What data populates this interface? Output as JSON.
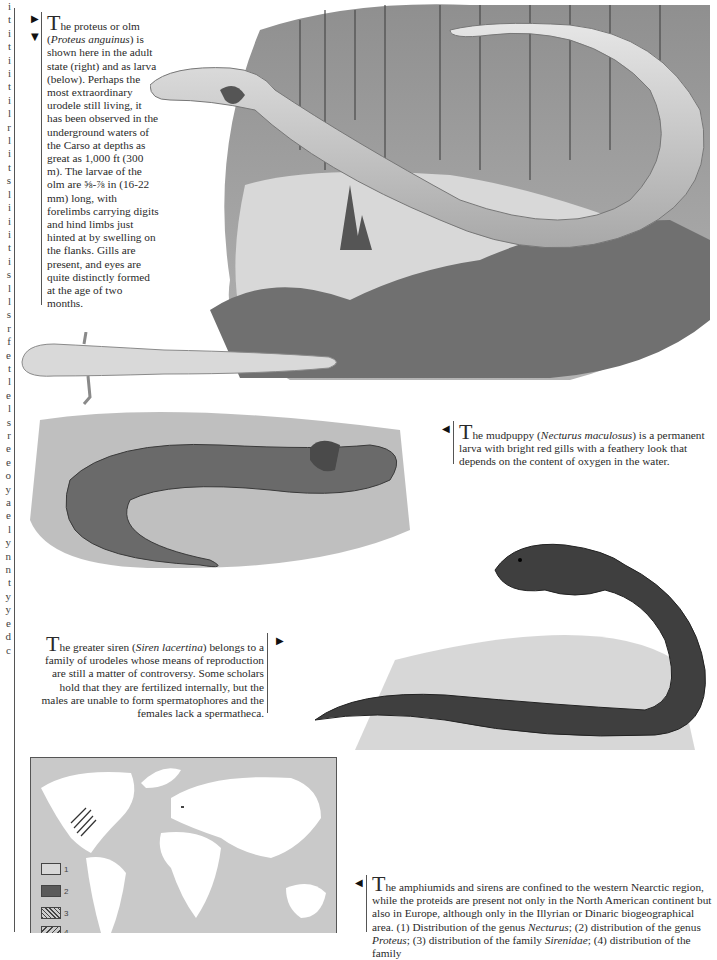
{
  "page": {
    "left_edge_cropped_letters": [
      "i",
      "t",
      "i",
      "t",
      "i",
      "i",
      "t",
      "i",
      "l",
      "r",
      "l",
      "i",
      "t",
      "s",
      "l",
      "i",
      "i",
      "i",
      "t",
      "i",
      "s",
      "l",
      "l",
      "s",
      "r",
      "f",
      "e",
      "t",
      "l",
      "e",
      "l",
      "s",
      "r",
      "e",
      "e",
      "o",
      "y",
      "a",
      "e",
      "l",
      "y",
      "n",
      "n",
      "t",
      "y",
      "y",
      "e",
      "d",
      "c"
    ]
  },
  "captions": {
    "proteus": {
      "drop_cap": "T",
      "parts": [
        {
          "text": "he proteus or olm (",
          "italic": false
        },
        {
          "text": "Proteus anguinus",
          "italic": true
        },
        {
          "text": ") is shown here in the adult state (right) and as larva (below). Perhaps the most extraordinary urodele still living, it has been observed in the underground waters of the Carso at depths as great as 1,000 ft (300 m). The larvae of the olm are ⅝-⅞ in (16-22 mm) long, with forelimbs carrying digits and hind limbs just hinted at by swelling on the flanks. Gills are present, and eyes are quite distinctly formed at the age of two months.",
          "italic": false
        }
      ],
      "pointer_icons": [
        "arrow-right",
        "arrow-down"
      ]
    },
    "mudpuppy": {
      "drop_cap": "T",
      "parts": [
        {
          "text": "he mudpuppy (",
          "italic": false
        },
        {
          "text": "Necturus maculosus",
          "italic": true
        },
        {
          "text": ") is a permanent larva with bright red gills with a feathery look that depends on the content of oxygen in the water.",
          "italic": false
        }
      ],
      "pointer_icons": [
        "arrow-left"
      ]
    },
    "siren": {
      "drop_cap": "T",
      "parts": [
        {
          "text": "he greater siren (",
          "italic": false
        },
        {
          "text": "Siren lacertina",
          "italic": true
        },
        {
          "text": ") belongs to a family of urodeles whose means of reproduction are still a matter of controversy. Some scholars hold that they are fertilized internally, but the males are unable to form spermatophores and the females lack a spermatheca.",
          "italic": false
        }
      ],
      "pointer_icons": [
        "arrow-right"
      ]
    },
    "distribution": {
      "drop_cap": "T",
      "parts": [
        {
          "text": "he amphiumids and sirens are confined to the western Nearctic region, while the proteids are present not only in the North American continent but also in Europe, although only in the Illyrian or Dinaric biogeographical area. (1) Distribution of the genus ",
          "italic": false
        },
        {
          "text": "Necturus",
          "italic": true
        },
        {
          "text": "; (2) distribution of the genus ",
          "italic": false
        },
        {
          "text": "Proteus",
          "italic": true
        },
        {
          "text": "; (3) distribution of the family ",
          "italic": false
        },
        {
          "text": "Sirenidae",
          "italic": true
        },
        {
          "text": "; (4) distribution of the family",
          "italic": false
        }
      ],
      "pointer_icons": [
        "arrow-left"
      ]
    }
  },
  "illustrations": [
    {
      "name": "proteus-adult-in-cave",
      "subject": "Proteus anguinus adult"
    },
    {
      "name": "proteus-larva",
      "subject": "Proteus larva"
    },
    {
      "name": "mudpuppy",
      "subject": "Necturus maculosus"
    },
    {
      "name": "greater-siren",
      "subject": "Siren lacertina"
    }
  ],
  "map": {
    "legend": [
      {
        "key": "1",
        "label": "1",
        "fill": "#d8d8d8",
        "pattern": "plain-light"
      },
      {
        "key": "2",
        "label": "2",
        "fill": "#5a5a5a",
        "pattern": "solid-dark"
      },
      {
        "key": "3",
        "label": "3",
        "fill": "#8a8a8a",
        "pattern": "dense-hatch"
      },
      {
        "key": "4",
        "label": "4",
        "fill": "#9a9a9a",
        "pattern": "diagonal-hatch"
      }
    ],
    "colors": {
      "ocean": "#c9c9c9",
      "land": "#ffffff"
    }
  },
  "colors": {
    "text": "#2a2a2a",
    "rule": "#555555",
    "paper": "#ffffff"
  }
}
